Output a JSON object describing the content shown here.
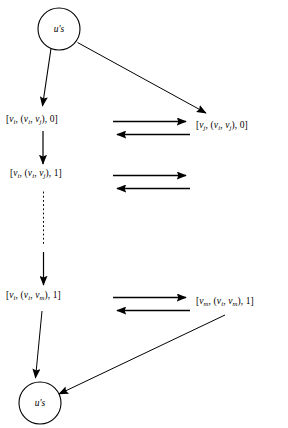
{
  "figure": {
    "type": "state-transition-diagram",
    "background_color": "#ffffff",
    "stroke_color": "#000000"
  },
  "nodes": {
    "top_circle": {
      "name": "start-state",
      "label": "u's",
      "cx": 59,
      "cy": 29,
      "r": 21
    },
    "bottom_circle": {
      "name": "end-state",
      "label": "u's",
      "cx": 40,
      "cy": 403,
      "r": 21
    },
    "left_column": [
      {
        "id": "left-1",
        "text": "[v_i, (v_i, v_j), 0]",
        "parts": {
          "first": "v",
          "first_sub": "i",
          "edge_a": "v",
          "edge_a_sub": "i",
          "edge_b": "v",
          "edge_b_sub": "j",
          "flag": "0"
        },
        "x": 6,
        "y": 121
      },
      {
        "id": "left-2",
        "text": "[v_i, (v_i, v_j), 1]",
        "parts": {
          "first": "v",
          "first_sub": "i",
          "edge_a": "v",
          "edge_a_sub": "i",
          "edge_b": "v",
          "edge_b_sub": "j",
          "flag": "1"
        },
        "x": 10,
        "y": 175
      },
      {
        "id": "left-3",
        "text": "[v_i, (v_i, v_m), 1]",
        "parts": {
          "first": "v",
          "first_sub": "i",
          "edge_a": "v",
          "edge_a_sub": "i",
          "edge_b": "v",
          "edge_b_sub": "m",
          "flag": "1"
        },
        "x": 6,
        "y": 297
      }
    ],
    "right_column": [
      {
        "id": "right-1",
        "text": "[v_j, (v_i, v_j), 0]",
        "parts": {
          "first": "v",
          "first_sub": "j",
          "edge_a": "v",
          "edge_a_sub": "i",
          "edge_b": "v",
          "edge_b_sub": "j",
          "flag": "0"
        },
        "x": 196,
        "y": 127
      },
      {
        "id": "right-2",
        "text": "[v_m, (v_i, v_m), 1]",
        "parts": {
          "first": "v",
          "first_sub": "m",
          "edge_a": "v",
          "edge_a_sub": "i",
          "edge_b": "v",
          "edge_b_sub": "m",
          "flag": "1"
        },
        "x": 198,
        "y": 303
      }
    ]
  },
  "edges": [
    {
      "id": "e1",
      "name": "start-to-left-1",
      "from": "top_circle",
      "to": "left-1",
      "style": "solid",
      "direction": "down"
    },
    {
      "id": "e2",
      "name": "start-to-right-1",
      "from": "top_circle",
      "to": "right-1",
      "style": "solid",
      "direction": "diagonal-down-right"
    },
    {
      "id": "e3",
      "name": "left-1-to-left-2",
      "from": "left-1",
      "to": "left-2",
      "style": "solid",
      "direction": "down"
    },
    {
      "id": "e4",
      "name": "left-2-to-left-3-dotted",
      "from": "left-2",
      "to": "left-3",
      "style": "dotted",
      "direction": "down"
    },
    {
      "id": "e5",
      "name": "dotted-continuation-arrow",
      "from": "left-2",
      "to": "left-3",
      "style": "solid",
      "direction": "down"
    },
    {
      "id": "e6",
      "name": "left-3-to-end",
      "from": "left-3",
      "to": "bottom_circle",
      "style": "solid",
      "direction": "down"
    },
    {
      "id": "e7",
      "name": "right-2-to-end",
      "from": "right-2",
      "to": "bottom_circle",
      "style": "solid",
      "direction": "diagonal-down-left"
    },
    {
      "id": "p1a",
      "name": "pair-1-forward",
      "row": 1,
      "direction": "right",
      "style": "solid"
    },
    {
      "id": "p1b",
      "name": "pair-1-backward",
      "row": 1,
      "direction": "left",
      "style": "solid"
    },
    {
      "id": "p2a",
      "name": "pair-2-forward",
      "row": 2,
      "direction": "right",
      "style": "solid"
    },
    {
      "id": "p2b",
      "name": "pair-2-backward",
      "row": 2,
      "direction": "left",
      "style": "solid"
    },
    {
      "id": "p3a",
      "name": "pair-3-forward",
      "row": 3,
      "direction": "right",
      "style": "solid"
    },
    {
      "id": "p3b",
      "name": "pair-3-backward",
      "row": 3,
      "direction": "left",
      "style": "solid"
    }
  ],
  "brackets": {
    "open": "[",
    "close": "]",
    "paren_open": "(",
    "paren_close": ")",
    "comma": ","
  }
}
